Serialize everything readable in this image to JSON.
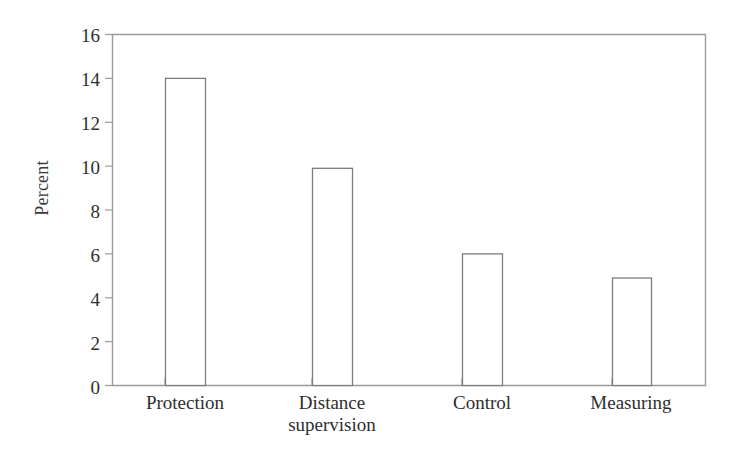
{
  "chart_data": {
    "type": "bar",
    "title": "",
    "subtitle": "",
    "xlabel": "",
    "ylabel": "Percent",
    "categories": [
      "Protection",
      "Distance\nsupervision",
      "Control",
      "Measuring"
    ],
    "values": [
      14,
      9.9,
      6,
      4.9
    ],
    "ylim": [
      0,
      16
    ],
    "yticks": [
      0,
      2,
      4,
      6,
      8,
      10,
      12,
      14,
      16
    ],
    "ytick_labels": [
      "0",
      "2",
      "4",
      "6",
      "8",
      "10",
      "12",
      "14",
      "16"
    ],
    "grid": false,
    "legend": null,
    "legend_position": "none",
    "bar_fill": "#ffffff",
    "bar_stroke": "#7d7d7d",
    "axis_color": "#9a9a9a",
    "background": "#ffffff",
    "annotations": []
  },
  "axes": {
    "y_title": "Percent",
    "y_ticks": [
      {
        "label": "16",
        "value": 16
      },
      {
        "label": "14",
        "value": 14
      },
      {
        "label": "12",
        "value": 12
      },
      {
        "label": "10",
        "value": 10
      },
      {
        "label": "8",
        "value": 8
      },
      {
        "label": "6",
        "value": 6
      },
      {
        "label": "4",
        "value": 4
      },
      {
        "label": "2",
        "value": 2
      },
      {
        "label": "0",
        "value": 0
      }
    ],
    "x_ticks": [
      {
        "label": "Protection"
      },
      {
        "label": "Distance\nsupervision"
      },
      {
        "label": "Control"
      },
      {
        "label": "Measuring"
      }
    ]
  }
}
